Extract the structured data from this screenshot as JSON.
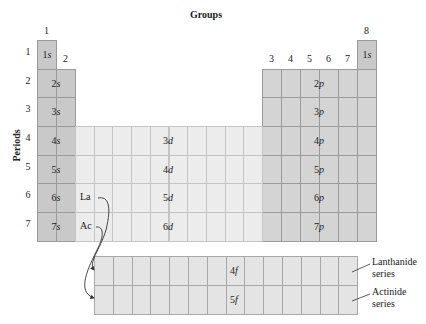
{
  "title": "Groups",
  "periods_label": "Periods",
  "group_numbers": [
    "1",
    "2",
    "3",
    "4",
    "5",
    "6",
    "7",
    "8"
  ],
  "period_numbers": [
    "1",
    "2",
    "3",
    "4",
    "5",
    "6",
    "7"
  ],
  "orbitals": {
    "s_top_left": {
      "n": "1",
      "l": "s"
    },
    "s_rows": [
      {
        "n": "2",
        "l": "s"
      },
      {
        "n": "3",
        "l": "s"
      },
      {
        "n": "4",
        "l": "s"
      },
      {
        "n": "5",
        "l": "s"
      },
      {
        "n": "6",
        "l": "s"
      },
      {
        "n": "7",
        "l": "s"
      }
    ],
    "s_top_right": {
      "n": "1",
      "l": "s"
    },
    "p_rows": [
      {
        "n": "2",
        "l": "p"
      },
      {
        "n": "3",
        "l": "p"
      },
      {
        "n": "4",
        "l": "p"
      },
      {
        "n": "5",
        "l": "p"
      },
      {
        "n": "6",
        "l": "p"
      },
      {
        "n": "7",
        "l": "p"
      }
    ],
    "d_rows": [
      {
        "n": "3",
        "l": "d"
      },
      {
        "n": "4",
        "l": "d"
      },
      {
        "n": "5",
        "l": "d"
      },
      {
        "n": "6",
        "l": "d"
      }
    ],
    "f_rows": [
      {
        "n": "4",
        "l": "f"
      },
      {
        "n": "5",
        "l": "f"
      }
    ]
  },
  "elements": {
    "la": "La",
    "ac": "Ac"
  },
  "series": {
    "lanthanide": [
      "Lanthanide",
      "series"
    ],
    "actinide": [
      "Actinide",
      "series"
    ]
  },
  "colors": {
    "s_block": "#c9c9c9",
    "p_block": "#d4d4d4",
    "d_block": "#ececec",
    "f_block": "#e4e4e4",
    "line": "#9a9a9a"
  }
}
